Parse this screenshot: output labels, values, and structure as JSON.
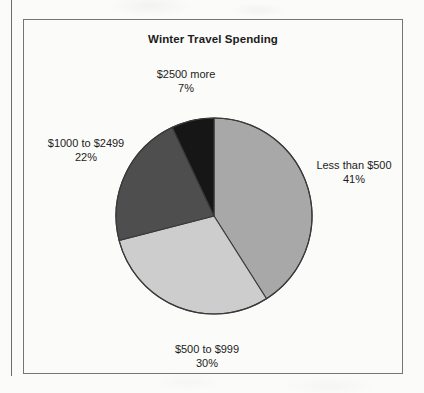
{
  "page": {
    "background_color": "#fbfbf9",
    "margin_rule_color": "#6d6d6d",
    "frame_color": "#757575"
  },
  "chart_data": {
    "type": "pie",
    "title": "Winter Travel Spending",
    "xlabel": "",
    "ylabel": "",
    "legend_position": "none",
    "grid": false,
    "labels_outside": true,
    "start_angle_deg": 0,
    "direction": "clockwise",
    "categories": [
      "Less than $500",
      "$500 to $999",
      "$1000 to $2499",
      "$2500 more"
    ],
    "values": [
      41,
      30,
      22,
      7
    ],
    "value_suffix": "%",
    "colors": [
      "#a8a8a8",
      "#cdcdcd",
      "#4e4e4e",
      "#161616"
    ],
    "slices": [
      {
        "label": "Less than $500",
        "percent_text": "41%",
        "value": 41,
        "color": "#a8a8a8",
        "label_position": "right"
      },
      {
        "label": "$500 to $999",
        "percent_text": "30%",
        "value": 30,
        "color": "#cdcdcd",
        "label_position": "bottom"
      },
      {
        "label": "$1000 to $2499",
        "percent_text": "22%",
        "value": 22,
        "color": "#4e4e4e",
        "label_position": "left"
      },
      {
        "label": "$2500 more",
        "percent_text": "7%",
        "value": 7,
        "color": "#161616",
        "label_position": "top"
      }
    ],
    "outline_color": "#3a3a3a"
  }
}
